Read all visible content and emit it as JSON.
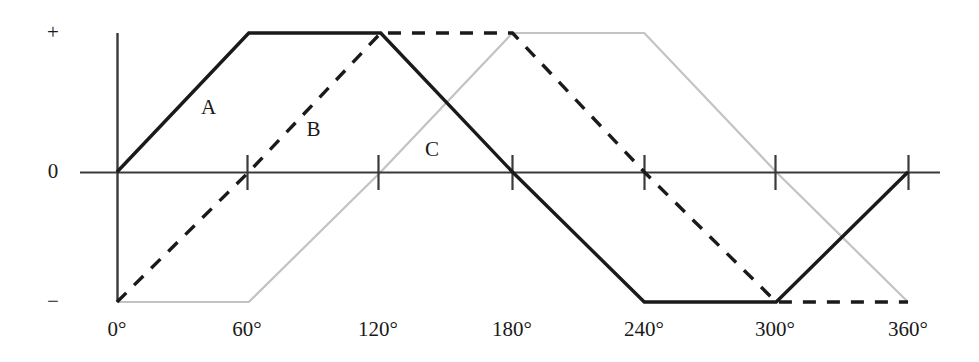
{
  "chart_data": {
    "type": "line",
    "title": "",
    "xlabel": "",
    "ylabel": "",
    "xlim": [
      0,
      360
    ],
    "ylim": [
      -1,
      1
    ],
    "grid": false,
    "legend_position": "inline-annotations",
    "x_ticks": [
      0,
      60,
      120,
      180,
      240,
      300,
      360
    ],
    "x_tick_labels": [
      "0°",
      "60°",
      "120°",
      "180°",
      "240°",
      "300°",
      "360°"
    ],
    "y_ticks": [
      -1,
      0,
      1
    ],
    "y_tick_labels": [
      "−",
      "0",
      "+"
    ],
    "series": [
      {
        "name": "A",
        "style": "solid",
        "color": "#1a1a1a",
        "label": "A",
        "label_x": 30,
        "label_y": 0.46,
        "x": [
          0,
          60,
          120,
          180,
          240,
          300,
          360
        ],
        "values": [
          0,
          1,
          1,
          0,
          -1,
          -1,
          0
        ]
      },
      {
        "name": "B",
        "style": "dashed",
        "color": "#1a1a1a",
        "label": "B",
        "label_x": 78,
        "label_y": 0.3,
        "x": [
          0,
          60,
          120,
          180,
          240,
          300,
          360
        ],
        "values": [
          -1,
          0,
          1,
          1,
          0,
          -1,
          -1
        ]
      },
      {
        "name": "C",
        "style": "solid",
        "color": "#c3c3c3",
        "label": "C",
        "label_x": 132,
        "label_y": 0.16,
        "x": [
          0,
          60,
          120,
          180,
          240,
          300,
          360
        ],
        "values": [
          -1,
          -1,
          0,
          1,
          1,
          0,
          -1
        ]
      }
    ]
  },
  "axis": {
    "plus_label": "+",
    "zero_label": "0",
    "minus_label": "−"
  },
  "x_labels": {
    "t0": "0°",
    "t60": "60°",
    "t120": "120°",
    "t180": "180°",
    "t240": "240°",
    "t300": "300°",
    "t360": "360°"
  },
  "curve_labels": {
    "a": "A",
    "b": "B",
    "c": "C"
  },
  "colors": {
    "axis": "#3a3a3a",
    "curve_a": "#1a1a1a",
    "curve_b": "#1a1a1a",
    "curve_c": "#c3c3c3",
    "background": "#ffffff"
  }
}
